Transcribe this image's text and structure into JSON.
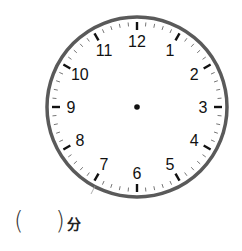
{
  "clock": {
    "center": [
      137,
      107
    ],
    "radius": 90,
    "rim_color": "#555555",
    "numbers": [
      "12",
      "1",
      "2",
      "3",
      "4",
      "5",
      "6",
      "7",
      "8",
      "9",
      "10",
      "11"
    ],
    "hands": "none",
    "center_dot": true
  },
  "question": {
    "open_paren": "(",
    "answer": "",
    "close_paren": ")",
    "unit": "分"
  }
}
